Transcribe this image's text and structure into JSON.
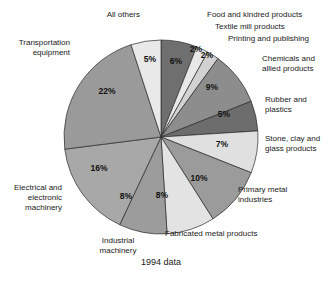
{
  "chart_data": {
    "type": "pie",
    "title": "",
    "caption": "1994 data",
    "units": "percent",
    "start_angle_deg": 0,
    "direction": "clockwise",
    "center": {
      "x": 161,
      "y": 137
    },
    "radius": 97,
    "total": 100,
    "slices": [
      {
        "label": "Food and kindred products",
        "value": 6,
        "value_label": "6%",
        "color": "#6f6f6f",
        "label_pos": {
          "x": 207,
          "y": 17
        },
        "label_anchor": "start",
        "pct_pos": {
          "x": 176,
          "y": 64
        },
        "leader": null
      },
      {
        "label": "Textile mill products",
        "value": 2,
        "value_label": "2%",
        "color": "#e8e8e8",
        "label_pos": {
          "x": 215,
          "y": 29
        },
        "label_anchor": "start",
        "pct_pos": {
          "x": 196,
          "y": 52
        },
        "leader": null
      },
      {
        "label": "Printing and publishing",
        "value": 2,
        "value_label": "2%",
        "color": "#d2d2d2",
        "label_pos": {
          "x": 228,
          "y": 41
        },
        "label_anchor": "start",
        "pct_pos": {
          "x": 207,
          "y": 58
        },
        "leader": null
      },
      {
        "label": "Chemicals and\nallied products",
        "value": 9,
        "value_label": "9%",
        "color": "#8d8d8d",
        "label_pos": {
          "x": 262,
          "y": 61
        },
        "label_anchor": "start",
        "pct_pos": {
          "x": 212,
          "y": 90
        },
        "leader": null
      },
      {
        "label": "Rubber and\nplastics",
        "value": 5,
        "value_label": "5%",
        "color": "#6d6d6d",
        "label_pos": {
          "x": 265,
          "y": 102
        },
        "label_anchor": "start",
        "pct_pos": {
          "x": 224,
          "y": 117
        },
        "leader": null
      },
      {
        "label": "Stone, clay and\nglass products",
        "value": 7,
        "value_label": "7%",
        "color": "#e0e0e0",
        "label_pos": {
          "x": 265,
          "y": 141
        },
        "label_anchor": "start",
        "pct_pos": {
          "x": 222,
          "y": 147
        },
        "leader": null
      },
      {
        "label": "Primary metal\nindustries",
        "value": 10,
        "value_label": "10%",
        "color": "#9b9b9b",
        "label_pos": {
          "x": 238,
          "y": 192
        },
        "label_anchor": "start",
        "pct_pos": {
          "x": 199,
          "y": 181
        },
        "leader": null
      },
      {
        "label": "Fabricated metal products",
        "value": 8,
        "value_label": "8%",
        "color": "#e3e3e3",
        "label_pos": {
          "x": 165,
          "y": 236
        },
        "label_anchor": "start",
        "pct_pos": {
          "x": 162,
          "y": 198
        },
        "leader": null
      },
      {
        "label": "Industrial\nmachinery",
        "value": 8,
        "value_label": "8%",
        "color": "#9c9c9c",
        "label_pos": {
          "x": 118,
          "y": 243
        },
        "label_anchor": "middle",
        "pct_pos": {
          "x": 126,
          "y": 199
        },
        "leader": null
      },
      {
        "label": "Electrical and\nelectronic\nmachinery",
        "value": 16,
        "value_label": "16%",
        "color": "#a8a8a8",
        "label_pos": {
          "x": 62,
          "y": 190
        },
        "label_anchor": "end",
        "pct_pos": {
          "x": 99,
          "y": 171
        },
        "leader": null
      },
      {
        "label": "Transportation\nequipment",
        "value": 22,
        "value_label": "22%",
        "color": "#9a9a9a",
        "label_pos": {
          "x": 70,
          "y": 45
        },
        "label_anchor": "end",
        "pct_pos": {
          "x": 107,
          "y": 94
        },
        "leader": null
      },
      {
        "label": "All others",
        "value": 5,
        "value_label": "5%",
        "color": "#e9e9e9",
        "label_pos": {
          "x": 140,
          "y": 17
        },
        "label_anchor": "end",
        "pct_pos": {
          "x": 150,
          "y": 62
        },
        "leader": null
      }
    ],
    "legend_position": "callout-labels",
    "grid": false,
    "xlabel": "",
    "ylabel": ""
  },
  "figure": {
    "caption": "1994 data",
    "caption_pos": {
      "x": 161,
      "y": 265
    },
    "background": "#ffffff",
    "outline_color": "#2b2b2b"
  }
}
